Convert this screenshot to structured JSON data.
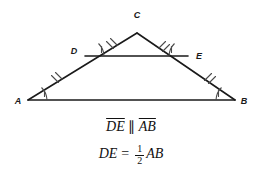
{
  "figure": {
    "type": "geometry-diagram",
    "background_color": "#ffffff",
    "stroke_color": "#1a1a1a"
  },
  "triangle": {
    "name": "ABC",
    "vertices": [
      {
        "id": "A",
        "label": "A",
        "x": 28,
        "y": 100,
        "label_x": 18,
        "label_y": 103
      },
      {
        "id": "B",
        "label": "B",
        "x": 235,
        "y": 100,
        "label_x": 241,
        "label_y": 103
      },
      {
        "id": "C",
        "label": "C",
        "x": 137,
        "y": 33,
        "label_x": 137,
        "label_y": 16
      }
    ],
    "midpoints": [
      {
        "id": "D",
        "label": "D",
        "x": 85,
        "y": 56,
        "label_x": 76,
        "label_y": 52,
        "on_side": "AC"
      },
      {
        "id": "E",
        "label": "E",
        "x": 188,
        "y": 56,
        "label_x": 196,
        "label_y": 57,
        "on_side": "CB"
      }
    ]
  },
  "segments": [
    {
      "name": "AC",
      "from": "A",
      "to": "C",
      "style": "solid"
    },
    {
      "name": "CB",
      "from": "C",
      "to": "B",
      "style": "solid"
    },
    {
      "name": "AB",
      "from": "A",
      "to": "B",
      "style": "solid"
    },
    {
      "name": "DE",
      "from": "D",
      "to": "E",
      "style": "solid"
    }
  ],
  "tick_marks": [
    {
      "on_segment": "AD",
      "count": 2,
      "meaning": "congruent"
    },
    {
      "on_segment": "DC",
      "count": 2,
      "meaning": "congruent"
    },
    {
      "on_segment": "CE",
      "count": 2,
      "meaning": "congruent"
    },
    {
      "on_segment": "EB",
      "count": 2,
      "meaning": "congruent"
    }
  ],
  "angle_marks": [
    {
      "at_vertex": "A",
      "count": 1,
      "meaning": "corresponding-angle"
    },
    {
      "at_vertex": "D",
      "count": 1,
      "meaning": "corresponding-angle"
    },
    {
      "at_vertex": "E",
      "count": 1,
      "meaning": "corresponding-angle"
    },
    {
      "at_vertex": "B",
      "count": 1,
      "meaning": "corresponding-angle"
    }
  ],
  "captions": {
    "parallel_statement": {
      "segment_1": "DE",
      "symbol": "∥",
      "segment_2": "AB"
    },
    "length_statement": {
      "left": "DE",
      "equals": "=",
      "numerator": "1",
      "denominator": "2",
      "right": "AB"
    }
  }
}
